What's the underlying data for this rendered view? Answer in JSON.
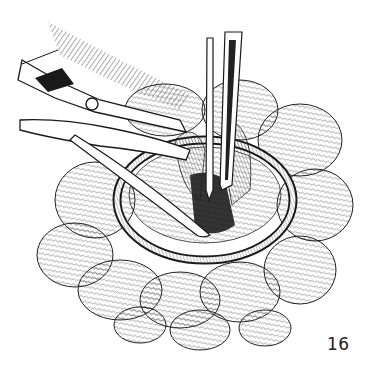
{
  "figure": {
    "number": "16",
    "colors": {
      "ink": "#1a1a1a",
      "paper": "#ffffff"
    }
  }
}
